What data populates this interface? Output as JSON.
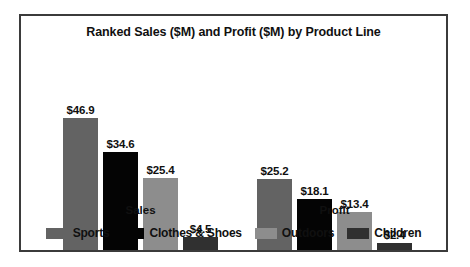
{
  "chart_data": {
    "type": "bar",
    "title": "Ranked Sales ($M) and Profit ($M) by Product Line",
    "xlabel": "",
    "ylabel": "",
    "categories": [
      "Sales",
      "Profit"
    ],
    "grid": false,
    "legend_position": "bottom",
    "ylim": [
      0,
      46.9
    ],
    "series": [
      {
        "name": "Sports",
        "color": "#636363",
        "values": [
          46.9,
          25.2
        ],
        "labels": [
          "$46.9",
          "$25.2"
        ]
      },
      {
        "name": "Clothes & Shoes",
        "color": "#040404",
        "values": [
          34.6,
          18.1
        ],
        "labels": [
          "$34.6",
          "$18.1"
        ]
      },
      {
        "name": "Outdoors",
        "color": "#8d8d8d",
        "values": [
          25.4,
          13.4
        ],
        "labels": [
          "$25.4",
          "$13.4"
        ]
      },
      {
        "name": "Children",
        "color": "#303030",
        "values": [
          4.5,
          2.4
        ],
        "labels": [
          "$4.5",
          "$2.4"
        ]
      }
    ]
  },
  "legend": {
    "items": [
      {
        "label": "Sports",
        "color": "#636363"
      },
      {
        "label": "Clothes & Shoes",
        "color": "#040404"
      },
      {
        "label": "Outdoors",
        "color": "#8d8d8d"
      },
      {
        "label": "Children",
        "color": "#303030"
      }
    ]
  },
  "axis": {
    "group_labels": [
      "Sales",
      "Profit"
    ]
  }
}
